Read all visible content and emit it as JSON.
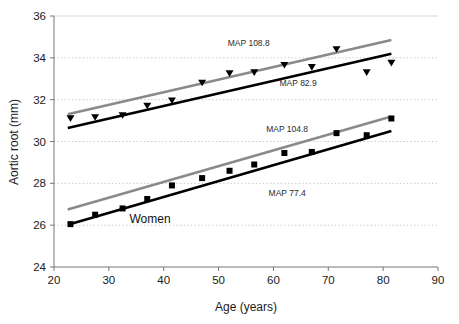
{
  "chart_data": {
    "type": "scatter",
    "title": "",
    "xlabel": "Age (years)",
    "ylabel": "Aortic root (mm)",
    "xlim": [
      20,
      90
    ],
    "ylim": [
      24,
      36
    ],
    "xticks": [
      20,
      30,
      40,
      50,
      60,
      70,
      80,
      90
    ],
    "yticks": [
      24,
      26,
      28,
      30,
      32,
      34,
      36
    ],
    "grid": true,
    "grid_style": "dotted",
    "grid_color": "#c8c8c8",
    "legend": "none",
    "colors": {
      "high_map_line": "#8a8a8a",
      "low_map_line": "#000000",
      "marker": "#000000",
      "axis": "#555555"
    },
    "series": [
      {
        "name": "Men observed",
        "group": "men",
        "marker": "triangle-down",
        "color": "#000000",
        "x": [
          23,
          27.5,
          32.5,
          37,
          41.5,
          47,
          52,
          56.5,
          62,
          67,
          71.5,
          77,
          81.5
        ],
        "y": [
          31.1,
          31.15,
          31.25,
          31.7,
          31.95,
          32.8,
          33.25,
          33.3,
          33.65,
          33.55,
          34.4,
          33.3,
          33.75
        ]
      },
      {
        "name": "Women observed",
        "group": "women",
        "marker": "square",
        "color": "#000000",
        "x": [
          23,
          27.5,
          32.5,
          37,
          41.5,
          47,
          52,
          56.5,
          62,
          67,
          71.5,
          77,
          81.5
        ],
        "y": [
          26.05,
          26.5,
          26.8,
          27.25,
          27.9,
          28.25,
          28.6,
          28.9,
          29.45,
          29.5,
          30.4,
          30.3,
          31.1
        ]
      },
      {
        "name": "MAP 108.8",
        "group": "men",
        "type": "regression-line",
        "color": "#8a8a8a",
        "x": [
          22.5,
          81.5
        ],
        "y": [
          31.3,
          34.85
        ]
      },
      {
        "name": "MAP 82.9",
        "group": "men",
        "type": "regression-line",
        "color": "#000000",
        "x": [
          22.5,
          81.5
        ],
        "y": [
          30.65,
          34.2
        ]
      },
      {
        "name": "MAP 104.8",
        "group": "women",
        "type": "regression-line",
        "color": "#8a8a8a",
        "x": [
          22.5,
          81.5
        ],
        "y": [
          26.75,
          31.2
        ]
      },
      {
        "name": "MAP 77.4",
        "group": "women",
        "type": "regression-line",
        "color": "#000000",
        "x": [
          23,
          81.5
        ],
        "y": [
          26.05,
          30.5
        ]
      }
    ],
    "annotations": [
      {
        "id": "map-108-8",
        "text": "MAP 108.8",
        "x": 55.5,
        "y": 34.55
      },
      {
        "id": "map-82-9",
        "text": "MAP 82.9",
        "x": 64.5,
        "y": 32.65
      },
      {
        "id": "map-104-8",
        "text": "MAP 104.8",
        "x": 62.5,
        "y": 30.45
      },
      {
        "id": "map-77-4",
        "text": "MAP 77.4",
        "x": 62.5,
        "y": 27.4
      },
      {
        "id": "women-label",
        "text": "Women",
        "x": 37.5,
        "y": 26.1
      }
    ]
  },
  "axes": {
    "x_title": "Age (years)",
    "y_title": "Aortic root (mm)",
    "x_tick_labels": [
      "20",
      "30",
      "40",
      "50",
      "60",
      "70",
      "80",
      "90"
    ],
    "y_tick_labels": [
      "24",
      "26",
      "28",
      "30",
      "32",
      "34",
      "36"
    ]
  }
}
